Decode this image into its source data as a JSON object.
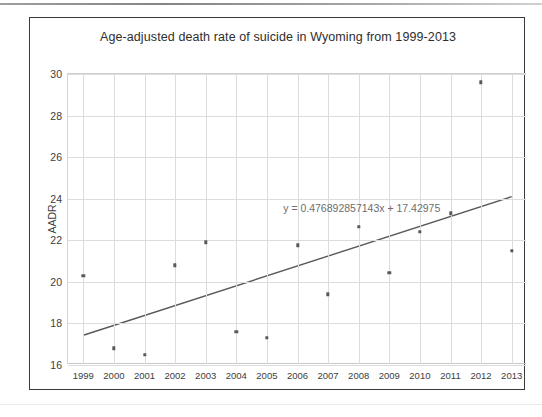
{
  "chart_data": {
    "type": "scatter",
    "title": "Age-adjusted death rate of suicide in Wyoming from 1999-2013",
    "xlabel": "",
    "ylabel": "AADR",
    "categories": [
      1999,
      2000,
      2001,
      2002,
      2003,
      2004,
      2005,
      2006,
      2007,
      2008,
      2009,
      2010,
      2011,
      2012,
      2013
    ],
    "x_tick_labels": [
      "1999",
      "2000",
      "2001",
      "2002",
      "2003",
      "2004",
      "2005",
      "2006",
      "2007",
      "2008",
      "2009",
      "2010",
      "2011",
      "2012",
      "2013"
    ],
    "y_tick_labels": [
      "30",
      "28",
      "26",
      "24",
      "22",
      "20",
      "18",
      "16"
    ],
    "y_ticks": [
      30,
      28,
      26,
      24,
      22,
      20,
      18,
      16
    ],
    "ylim": [
      16,
      30
    ],
    "xlim": [
      1998.5,
      2013.5
    ],
    "grid": true,
    "legend": false,
    "series": [
      {
        "name": "AADR",
        "marker": "square",
        "color": "#595959",
        "values": [
          20.3,
          16.8,
          16.5,
          20.8,
          21.9,
          17.6,
          17.3,
          21.75,
          19.4,
          22.65,
          20.45,
          22.4,
          23.3,
          29.6,
          21.5
        ]
      }
    ],
    "points": [
      {
        "x": 1999,
        "y": 20.3
      },
      {
        "x": 2000,
        "y": 16.8
      },
      {
        "x": 2001,
        "y": 16.5
      },
      {
        "x": 2002,
        "y": 20.8
      },
      {
        "x": 2003,
        "y": 21.9
      },
      {
        "x": 2004,
        "y": 17.6
      },
      {
        "x": 2005,
        "y": 17.3
      },
      {
        "x": 2006,
        "y": 21.75
      },
      {
        "x": 2007,
        "y": 19.4
      },
      {
        "x": 2008,
        "y": 22.65
      },
      {
        "x": 2009,
        "y": 20.45
      },
      {
        "x": 2010,
        "y": 22.4
      },
      {
        "x": 2011,
        "y": 23.3
      },
      {
        "x": 2012,
        "y": 29.6
      },
      {
        "x": 2013,
        "y": 21.5
      }
    ],
    "trendline": {
      "type": "linear",
      "slope": 0.476892857143,
      "intercept": 17.42975,
      "equation": "y = 0.476892857143x + 17.42975",
      "color": "#595959",
      "x_start": 1999,
      "x_end": 2013,
      "y_start": 17.42975,
      "y_end": 24.1,
      "label_x": 2008.1,
      "label_y": 23.55
    },
    "colors": {
      "marker": "#595959",
      "trendline": "#595959",
      "grid": "#dcdcdc",
      "frame": "#3a3a3a",
      "text": "#3d3d3d",
      "equation_text": "#6d6d6d"
    }
  }
}
